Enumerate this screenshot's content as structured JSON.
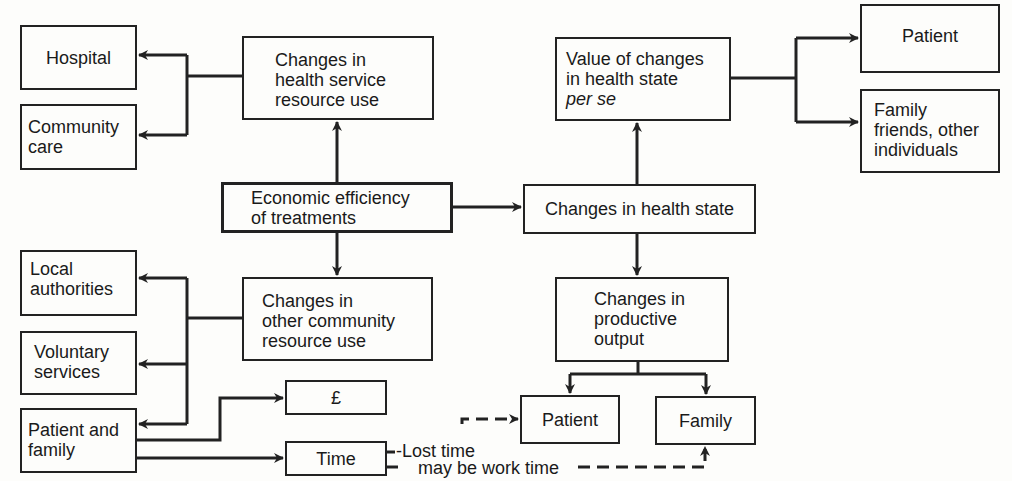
{
  "diagram": {
    "central": {
      "label": "Economic efficiency\nof treatments"
    },
    "health_service": {
      "label": "Changes in\nhealth service\nresource use",
      "targets": [
        {
          "label": "Hospital"
        },
        {
          "label": "Community\ncare"
        }
      ]
    },
    "other_community": {
      "label": "Changes in\nother community\nresource use",
      "targets": [
        {
          "label": "Local\nauthorities"
        },
        {
          "label": "Voluntary\nservices"
        },
        {
          "label": "Patient and\nfamily"
        }
      ]
    },
    "patient_family_costs": [
      {
        "label": "£"
      },
      {
        "label": "Time"
      }
    ],
    "health_state": {
      "label": "Changes in health state"
    },
    "value_changes": {
      "label": "Value of changes\nin health state",
      "label_italic": "per se",
      "targets": [
        {
          "label": "Patient"
        },
        {
          "label": "Family\nfriends, other\nindividuals"
        }
      ]
    },
    "productive_output": {
      "label": "Changes in\nproductive\noutput",
      "targets": [
        {
          "label": "Patient"
        },
        {
          "label": "Family"
        }
      ]
    },
    "annotations": {
      "lost_time": "-Lost time",
      "work_time": "may be work time"
    }
  }
}
